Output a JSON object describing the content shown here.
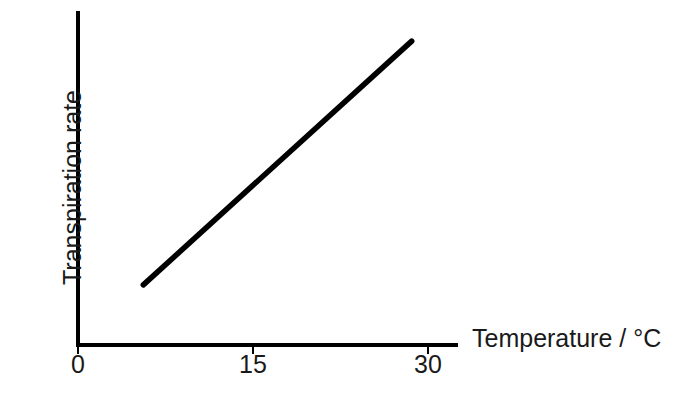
{
  "chart_data": {
    "type": "line",
    "title": "",
    "subtitle": "",
    "xlabel": "Temperature / °C",
    "ylabel": "Transpiration rate",
    "xlim": [
      0,
      33
    ],
    "ylim": [
      0,
      1
    ],
    "grid": false,
    "legend": null,
    "x_ticks": [
      {
        "value": 0,
        "label": "0"
      },
      {
        "value": 15,
        "label": "15"
      },
      {
        "value": 30,
        "label": "30"
      }
    ],
    "y_ticks": [],
    "series": [
      {
        "name": "Transpiration rate vs temperature",
        "style": "straight-line",
        "color": "#000000",
        "line_width": 5,
        "x": [
          5.6,
          28.6
        ],
        "y": [
          0.18,
          0.91
        ],
        "description": "Transpiration rate increases linearly with temperature"
      }
    ],
    "annotations": []
  },
  "axes": {
    "x_axis_label": "Temperature / °C",
    "y_axis_label": "Transpiration rate",
    "tick_labels": {
      "t0": "0",
      "t15": "15",
      "t30": "30"
    }
  },
  "colors": {
    "background": "#ffffff",
    "axis": "#000000",
    "data_line": "#000000",
    "text": "#1a1a1a"
  }
}
